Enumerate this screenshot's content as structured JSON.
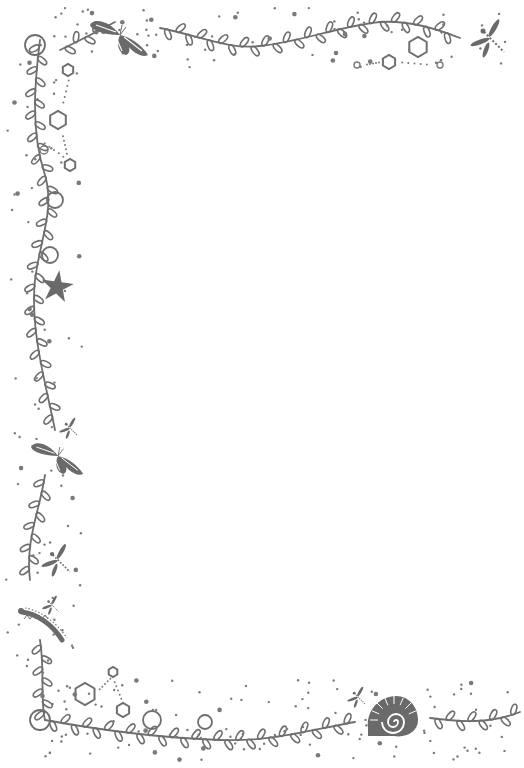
{
  "page": {
    "kind": "decorative stationery border",
    "background": "#ffffff",
    "ink_color": "#6e6e6e",
    "writing_area_text": ""
  },
  "decorations": {
    "vines": [
      {
        "name": "top-vine",
        "path": "M60,50 C85,38 100,30 115,22"
      },
      {
        "name": "top-right-vine",
        "path": "M160,28 C200,36 230,50 260,46 C300,42 340,26 380,22 C410,20 440,30 460,38"
      },
      {
        "name": "left-vine",
        "path": "M40,40 C35,80 30,130 45,175 C55,210 40,240 35,280 C30,330 45,380 55,430"
      },
      {
        "name": "left-lower-vine",
        "path": "M45,475 C40,510 25,540 30,580"
      },
      {
        "name": "bottom-left-vine",
        "path": "M40,640 C45,670 40,700 45,720"
      },
      {
        "name": "bottom-vine",
        "path": "M45,720 C100,730 160,738 220,740 C270,742 310,730 355,722"
      },
      {
        "name": "bottom-right-vine",
        "path": "M430,718 C460,722 490,724 520,712"
      }
    ],
    "loops": [
      {
        "cx": 35,
        "cy": 45,
        "r": 10
      },
      {
        "cx": 55,
        "cy": 200,
        "r": 8
      },
      {
        "cx": 50,
        "cy": 255,
        "r": 8
      },
      {
        "cx": 152,
        "cy": 720,
        "r": 9
      },
      {
        "cx": 205,
        "cy": 722,
        "r": 7
      },
      {
        "cx": 40,
        "cy": 720,
        "r": 10
      }
    ],
    "hexagons": [
      {
        "cx": 68,
        "cy": 70,
        "r": 6
      },
      {
        "cx": 58,
        "cy": 120,
        "r": 9
      },
      {
        "cx": 70,
        "cy": 165,
        "r": 6
      },
      {
        "cx": 418,
        "cy": 47,
        "r": 10
      },
      {
        "cx": 389,
        "cy": 62,
        "r": 7
      },
      {
        "cx": 85,
        "cy": 694,
        "r": 11
      },
      {
        "cx": 123,
        "cy": 710,
        "r": 7
      },
      {
        "cx": 113,
        "cy": 672,
        "r": 5
      }
    ],
    "rings": [
      {
        "cx": 357,
        "cy": 65,
        "r": 3
      },
      {
        "cx": 440,
        "cy": 65,
        "r": 3
      },
      {
        "cx": 44,
        "cy": 150,
        "r": 4
      }
    ],
    "creatures": [
      {
        "name": "moth-top",
        "x": 120,
        "y": 35,
        "scale": 1.0,
        "type": "moth"
      },
      {
        "name": "dragonfly-top-right",
        "x": 490,
        "y": 38,
        "scale": 1.0,
        "type": "dragonfly"
      },
      {
        "name": "starfish-left",
        "x": 57,
        "y": 287,
        "scale": 1.0,
        "type": "starfish"
      },
      {
        "name": "dragonfly-left-small",
        "x": 70,
        "y": 428,
        "scale": 0.55,
        "type": "dragonfly"
      },
      {
        "name": "butterfly-left",
        "x": 58,
        "y": 456,
        "scale": 0.9,
        "type": "butterfly"
      },
      {
        "name": "dragonfly-left-lower",
        "x": 58,
        "y": 560,
        "scale": 0.85,
        "type": "dragonfly"
      },
      {
        "name": "dragonfly-left-tiny",
        "x": 52,
        "y": 605,
        "scale": 0.5,
        "type": "dragonfly"
      },
      {
        "name": "caterpillar-left",
        "x": 22,
        "y": 612,
        "scale": 1.0,
        "type": "caterpillar"
      },
      {
        "name": "dragonfly-bottom",
        "x": 358,
        "y": 697,
        "scale": 0.55,
        "type": "dragonfly"
      },
      {
        "name": "snail-shell-bottom",
        "x": 390,
        "y": 716,
        "scale": 1.0,
        "type": "shell"
      }
    ]
  }
}
